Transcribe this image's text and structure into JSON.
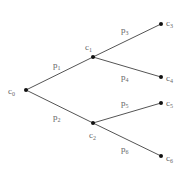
{
  "diagram": {
    "type": "probability-tree",
    "nodes": [
      {
        "id": "c0",
        "base": "c",
        "sub": "0",
        "x": 26,
        "y": 90,
        "lx": 8,
        "ly": 94
      },
      {
        "id": "c1",
        "base": "c",
        "sub": "1",
        "x": 93,
        "y": 57,
        "lx": 85,
        "ly": 50
      },
      {
        "id": "c2",
        "base": "c",
        "sub": "2",
        "x": 93,
        "y": 123,
        "lx": 89,
        "ly": 138
      },
      {
        "id": "c3",
        "base": "c",
        "sub": "3",
        "x": 161,
        "y": 24,
        "lx": 166,
        "ly": 26
      },
      {
        "id": "c4",
        "base": "c",
        "sub": "4",
        "x": 161,
        "y": 77,
        "lx": 166,
        "ly": 81
      },
      {
        "id": "c5",
        "base": "c",
        "sub": "5",
        "x": 161,
        "y": 103,
        "lx": 166,
        "ly": 106
      },
      {
        "id": "c6",
        "base": "c",
        "sub": "6",
        "x": 161,
        "y": 156,
        "lx": 166,
        "ly": 161
      }
    ],
    "edges": [
      {
        "from": "c0",
        "to": "c1",
        "base": "p",
        "sub": "1",
        "lx": 53,
        "ly": 68
      },
      {
        "from": "c0",
        "to": "c2",
        "base": "p",
        "sub": "2",
        "lx": 53,
        "ly": 120
      },
      {
        "from": "c1",
        "to": "c3",
        "base": "p",
        "sub": "3",
        "lx": 121,
        "ly": 33
      },
      {
        "from": "c1",
        "to": "c4",
        "base": "p",
        "sub": "4",
        "lx": 121,
        "ly": 80
      },
      {
        "from": "c2",
        "to": "c5",
        "base": "p",
        "sub": "5",
        "lx": 121,
        "ly": 106
      },
      {
        "from": "c2",
        "to": "c6",
        "base": "p",
        "sub": "6",
        "lx": 121,
        "ly": 152
      }
    ]
  }
}
